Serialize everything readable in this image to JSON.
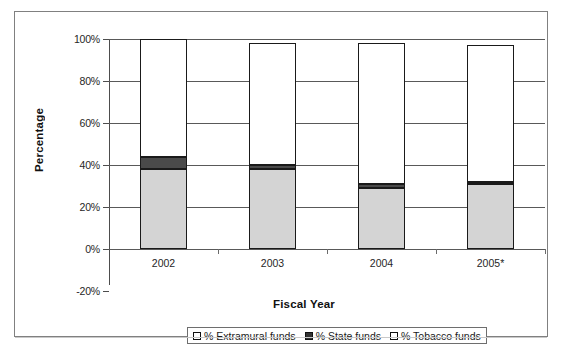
{
  "chart_data": {
    "type": "bar",
    "stacked": true,
    "title": "",
    "xlabel": "Fiscal Year",
    "ylabel": "Percentage",
    "categories": [
      "2002",
      "2003",
      "2004",
      "2005*"
    ],
    "ylim": [
      -20,
      100
    ],
    "yticks": [
      "-20%",
      "0%",
      "20%",
      "40%",
      "60%",
      "80%",
      "100%"
    ],
    "ytick_values": [
      -20,
      0,
      20,
      40,
      60,
      80,
      100
    ],
    "grid": true,
    "legend_position": "bottom",
    "series": [
      {
        "name": "% Tobacco funds",
        "key": "tobacco",
        "color": "#d4d4d4",
        "values": [
          38,
          38,
          29,
          31
        ]
      },
      {
        "name": "% State funds",
        "key": "state",
        "color": "#4a4a4a",
        "values": [
          6,
          2,
          2,
          1
        ]
      },
      {
        "name": "% Extramural funds",
        "key": "extra",
        "color": "#ffffff",
        "values": [
          56,
          58,
          67,
          65
        ]
      }
    ],
    "bar_totals": [
      100,
      98,
      98,
      97
    ],
    "legend_entries": [
      "% Extramural funds",
      "% State funds",
      "% Tobacco funds"
    ]
  },
  "axes": {
    "y_title": "Percentage",
    "x_title": "Fiscal Year"
  }
}
